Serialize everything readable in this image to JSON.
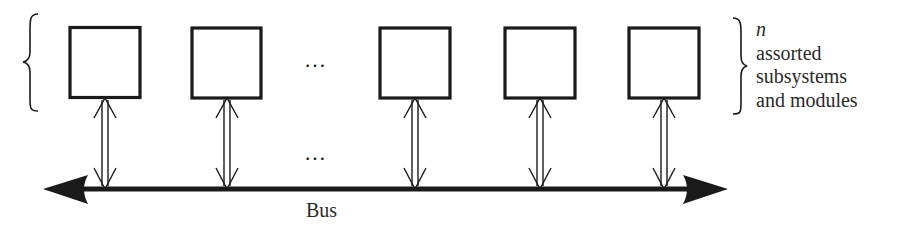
{
  "diagram": {
    "type": "bus-architecture",
    "modules": [
      {
        "id": 1,
        "x": 69,
        "center_x": 105
      },
      {
        "id": 2,
        "x": 191,
        "center_x": 227
      },
      {
        "id": 3,
        "x": 379,
        "center_x": 415
      },
      {
        "id": 4,
        "x": 504,
        "center_x": 540
      },
      {
        "id": 5,
        "x": 628,
        "center_x": 664
      }
    ],
    "module_size": 72,
    "module_top": 27,
    "ellipsis_top": "…",
    "ellipsis_bottom": "…",
    "bus": {
      "label": "Bus",
      "direction": "bidirectional",
      "y": 189
    },
    "connections": "bidirectional double arrows between each module and the bus",
    "annotation": {
      "variable": "n",
      "lines": [
        "assorted",
        "subsystems",
        "and modules"
      ]
    },
    "colors": {
      "stroke": "#1a1a1a",
      "background": "#ffffff"
    }
  }
}
